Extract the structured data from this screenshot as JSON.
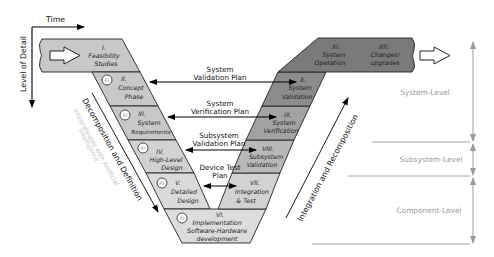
{
  "axes": {
    "time_label": "Time",
    "detail_label": "Level of Detail"
  },
  "left_arm": {
    "phases": [
      {
        "num": "I.",
        "line1": "Feasibility",
        "line2": "Studies",
        "line3": "",
        "ai": false
      },
      {
        "num": "II.",
        "line1": "Concept",
        "line2": "Phase",
        "line3": "",
        "ai": true
      },
      {
        "num": "III.",
        "line1": "System",
        "line2": "Requirements",
        "line3": "",
        "ai": true
      },
      {
        "num": "IV.",
        "line1": "High-Level",
        "line2": "Design",
        "line3": "",
        "ai": true
      },
      {
        "num": "V.",
        "line1": "Detailed",
        "line2": "Design",
        "line3": "",
        "ai": true
      }
    ],
    "diagonal_label": "Decomposition and Definition",
    "ai_note_line1": "Integrateable with Artificial",
    "ai_note_line2": "Intelligence"
  },
  "bottom": {
    "num": "VI.",
    "line1": "Implementation",
    "line2": "Software-Hardware",
    "line3": "development",
    "ai": true
  },
  "right_arm": {
    "phases": [
      {
        "num": "VII.",
        "line1": "Integration",
        "line2": "& Test"
      },
      {
        "num": "VIII.",
        "line1": "Subsystem",
        "line2": "Validation"
      },
      {
        "num": "IX.",
        "line1": "System",
        "line2": "Verification"
      },
      {
        "num": "X.",
        "line1": "System",
        "line2": "Validation"
      },
      {
        "num": "XI.",
        "line1": "System",
        "line2": "Operation"
      },
      {
        "num": "XII.",
        "line1": "Changes/",
        "line2": "upgrades"
      }
    ],
    "diagonal_label": "Integration and Recomposition"
  },
  "plans": [
    {
      "line1": "System",
      "line2": "Validation Plan"
    },
    {
      "line1": "System",
      "line2": "Verification Plan"
    },
    {
      "line1": "Subsystem",
      "line2": "Validation Plan"
    },
    {
      "line1": "Device Test",
      "line2": "Plan"
    }
  ],
  "ai_badge": "AI",
  "levels": [
    {
      "label": "System-Level"
    },
    {
      "label": "Subsystem-Level"
    },
    {
      "label": "Component-Level"
    }
  ],
  "colors": {
    "left_fill": "#c8c8c8",
    "bottom_fill": "#dcdcdc",
    "right_dark": "#7a7a7a",
    "level_gray": "#9a9a9a",
    "ai_note": "#c4c4c4"
  }
}
